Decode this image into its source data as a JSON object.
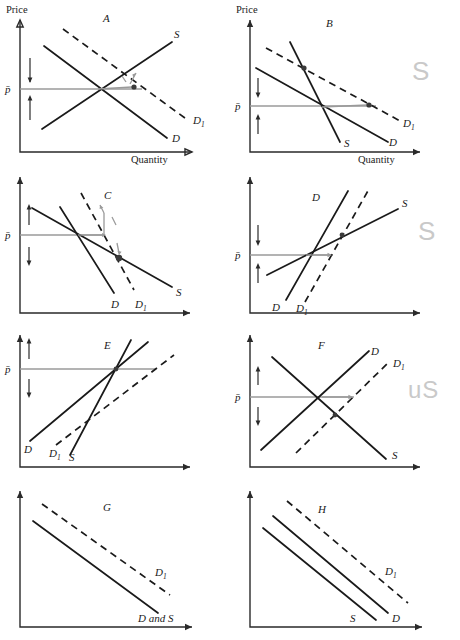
{
  "figure": {
    "kind": "economics-supply-demand-panel-figure",
    "panel_count": 8,
    "axis_labels": {
      "y": "Price",
      "x": "Quantity",
      "price_bar": "p̄"
    },
    "curve_labels": {
      "supply": "S",
      "demand": "D",
      "demand_shift": "D",
      "demand_shift_sub": "1",
      "both": "D and S"
    }
  },
  "panels": [
    {
      "id": "A",
      "letter": "A",
      "show_axis_titles": true,
      "y_title": "Price",
      "x_title": "Quantity",
      "price_label": "p̄",
      "labels": [
        {
          "name": "supply-label",
          "text": "S"
        },
        {
          "name": "demand-label",
          "text": "D"
        },
        {
          "name": "demand-shift-label",
          "text": "D",
          "sub": "1"
        }
      ],
      "description": "Upward sloping S, downward sloping D, dashed D1 shifted right; gray horizontal arrow right to new point plus gray up arrow; two black vertical arrows at the price axis."
    },
    {
      "id": "B",
      "letter": "B",
      "show_axis_titles": true,
      "y_title": "Price",
      "x_title": "Quantity",
      "price_label": "p̄",
      "labels": [
        {
          "name": "supply-label",
          "text": "S"
        },
        {
          "name": "demand-label",
          "text": "D"
        },
        {
          "name": "demand-shift-label",
          "text": "D",
          "sub": "1"
        }
      ],
      "description": "Steep downward S line, flatter D, dashed D1 above/right; gray horizontal arrow right along price line."
    },
    {
      "id": "C",
      "letter": "C",
      "show_axis_titles": false,
      "price_label": "p̄",
      "labels": [
        {
          "name": "demand-label",
          "text": "D"
        },
        {
          "name": "demand-shift-label",
          "text": "D",
          "sub": "1"
        },
        {
          "name": "supply-label",
          "text": "S"
        }
      ],
      "description": "Two downward lines and a dashed line; gray arrows showing movement down-right to new intersection."
    },
    {
      "id": "D",
      "letter": "D",
      "show_axis_titles": false,
      "price_label": "p̄",
      "labels": [
        {
          "name": "demand-label-top",
          "text": "D"
        },
        {
          "name": "supply-label",
          "text": "S"
        },
        {
          "name": "demand-label-bottom",
          "text": "D"
        },
        {
          "name": "demand-shift-label",
          "text": "D",
          "sub": "1"
        }
      ],
      "description": "Steep upward D, flatter upward S, dashed D1 to the right; gray horizontal arrow right."
    },
    {
      "id": "E",
      "letter": "E",
      "show_axis_titles": false,
      "price_label": "p̄",
      "labels": [
        {
          "name": "demand-label",
          "text": "D"
        },
        {
          "name": "demand-shift-label",
          "text": "D",
          "sub": "1"
        },
        {
          "name": "supply-label",
          "text": "S"
        }
      ],
      "description": "Two upward solid lines and a dashed upward line; long gray horizontal price line."
    },
    {
      "id": "F",
      "letter": "F",
      "show_axis_titles": false,
      "price_label": "p̄",
      "labels": [
        {
          "name": "demand-label",
          "text": "D"
        },
        {
          "name": "demand-shift-label",
          "text": "D",
          "sub": "1"
        },
        {
          "name": "supply-label",
          "text": "S"
        }
      ],
      "description": "Upward D, downward S crossing, dashed D1 parallel right of D; gray horizontal arrow right to a point."
    },
    {
      "id": "G",
      "letter": "G",
      "show_axis_titles": false,
      "labels": [
        {
          "name": "demand-shift-label",
          "text": "D",
          "sub": "1"
        },
        {
          "name": "both-curves-label",
          "text": "D and S"
        }
      ],
      "description": "One solid downward line and one dashed downward line above it, parallel."
    },
    {
      "id": "H",
      "letter": "H",
      "show_axis_titles": false,
      "labels": [
        {
          "name": "demand-shift-label",
          "text": "D",
          "sub": "1"
        },
        {
          "name": "demand-label",
          "text": "D"
        },
        {
          "name": "supply-label",
          "text": "S"
        }
      ],
      "description": "Two solid downward parallel lines and one dashed downward line above, all parallel."
    }
  ],
  "annotations": [
    {
      "name": "handwritten-note-row1",
      "text": "S"
    },
    {
      "name": "handwritten-note-row2",
      "text": "S"
    },
    {
      "name": "handwritten-note-row3",
      "text": "uS"
    }
  ]
}
